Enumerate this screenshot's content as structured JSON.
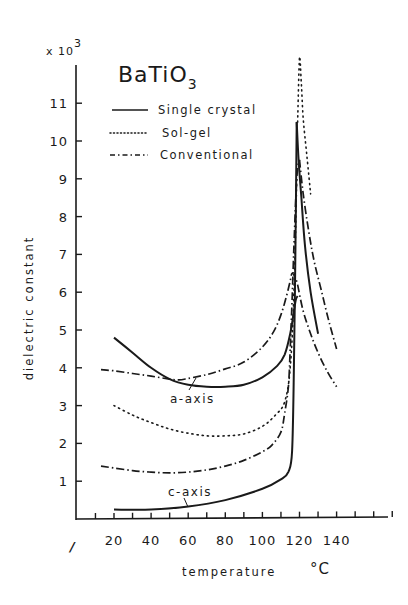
{
  "chart_data": {
    "type": "line",
    "title": "BaTiO3",
    "title_main": "BaTiO",
    "title_sub": "3",
    "xlabel": "temperature",
    "xunit": "°C",
    "ylabel": "dielectric constant",
    "y_multiplier": "x 10",
    "y_multiplier_exp": "3",
    "xlim": [
      0,
      160
    ],
    "ylim": [
      0,
      12
    ],
    "x_ticks": [
      20,
      40,
      60,
      80,
      100,
      120,
      140
    ],
    "x_tick_labels": [
      "20",
      "40",
      "60",
      "80",
      "100",
      "120",
      "140"
    ],
    "x_axis_break": "/",
    "y_ticks": [
      1,
      2,
      3,
      4,
      5,
      6,
      7,
      8,
      9,
      10,
      11
    ],
    "y_tick_labels": [
      "1",
      "2",
      "3",
      "4",
      "5",
      "6",
      "7",
      "8",
      "9",
      "10",
      "11"
    ],
    "grid": false,
    "legend_position": "upper-left",
    "legend": [
      {
        "label": "Single crystal",
        "style": "solid"
      },
      {
        "label": "Sol-gel",
        "style": "dotted"
      },
      {
        "label": "Conventional",
        "style": "dash-dot"
      }
    ],
    "annotations": [
      {
        "text": "a-axis",
        "x": 70,
        "y": 3.1
      },
      {
        "text": "c-axis",
        "x": 70,
        "y": 0.65
      }
    ],
    "series": [
      {
        "name": "Single crystal (a-axis)",
        "style": "solid",
        "x": [
          20,
          30,
          40,
          50,
          60,
          70,
          80,
          90,
          100,
          108,
          112,
          115,
          117,
          118,
          119
        ],
        "y": [
          4.8,
          4.4,
          4.0,
          3.7,
          3.55,
          3.5,
          3.5,
          3.55,
          3.75,
          4.05,
          4.35,
          4.9,
          5.5,
          5.8,
          5.9
        ]
      },
      {
        "name": "Single crystal (c-axis)",
        "style": "solid",
        "x": [
          20,
          40,
          60,
          80,
          100,
          110,
          114,
          116,
          117,
          118,
          118.5
        ],
        "y": [
          0.25,
          0.25,
          0.33,
          0.5,
          0.8,
          1.05,
          1.25,
          1.8,
          4.0,
          8.0,
          10.5
        ]
      },
      {
        "name": "Single crystal (above Tc)",
        "style": "solid",
        "x": [
          118.5,
          119.5,
          121,
          123,
          126,
          130
        ],
        "y": [
          10.5,
          9.5,
          8.5,
          7.2,
          6.0,
          4.9
        ]
      },
      {
        "name": "Sol-gel (low branch)",
        "style": "dotted",
        "x": [
          20,
          30,
          40,
          50,
          60,
          70,
          80,
          90,
          100,
          107,
          112,
          115,
          117,
          118.5
        ],
        "y": [
          3.0,
          2.75,
          2.55,
          2.38,
          2.27,
          2.2,
          2.2,
          2.25,
          2.45,
          2.75,
          3.1,
          4.0,
          6.0,
          9.0
        ]
      },
      {
        "name": "Sol-gel (peak/above Tc)",
        "style": "dotted",
        "x": [
          119,
          120,
          121,
          122,
          124,
          126
        ],
        "y": [
          10.5,
          12.2,
          11.5,
          10.6,
          9.6,
          8.6
        ]
      },
      {
        "name": "Conventional (upper)",
        "style": "dash-dot",
        "x": [
          13,
          20,
          30,
          40,
          50,
          55,
          60,
          70,
          80,
          90,
          100,
          106,
          110,
          113,
          115,
          116,
          118,
          119
        ],
        "y": [
          3.95,
          3.92,
          3.85,
          3.78,
          3.7,
          3.68,
          3.72,
          3.82,
          3.97,
          4.15,
          4.55,
          4.95,
          5.4,
          5.9,
          6.3,
          6.5,
          6.35,
          6.2
        ]
      },
      {
        "name": "Conventional (upper, above Tc)",
        "style": "dash-dot",
        "x": [
          119,
          122,
          126,
          130,
          135,
          140
        ],
        "y": [
          6.2,
          5.5,
          4.9,
          4.4,
          3.9,
          3.5
        ]
      },
      {
        "name": "Conventional (lower)",
        "style": "dash-dot",
        "x": [
          13,
          20,
          30,
          40,
          50,
          60,
          70,
          80,
          90,
          100,
          105,
          110,
          112,
          114,
          115,
          116,
          117,
          118,
          119,
          120
        ],
        "y": [
          1.4,
          1.35,
          1.28,
          1.24,
          1.22,
          1.24,
          1.3,
          1.4,
          1.55,
          1.78,
          1.95,
          2.3,
          2.8,
          3.5,
          4.5,
          5.8,
          7.2,
          8.5,
          9.3,
          9.5
        ]
      },
      {
        "name": "Conventional (lower, above Tc)",
        "style": "dash-dot",
        "x": [
          120,
          122,
          125,
          128,
          132,
          136,
          140
        ],
        "y": [
          9.5,
          8.6,
          7.6,
          6.8,
          6.0,
          5.2,
          4.5
        ]
      }
    ]
  }
}
